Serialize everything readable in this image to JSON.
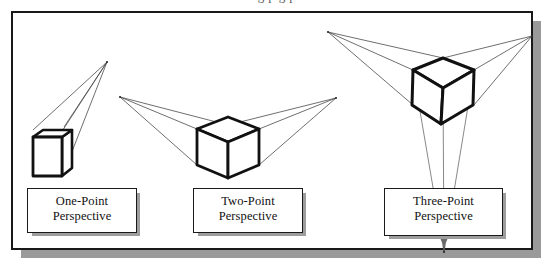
{
  "page": {
    "cutoff_text_above": "g    p     g p",
    "background_color": "#ffffff",
    "frame_border_color": "#19191a",
    "shadow_color": "#9a9a9a",
    "line_color": "#3a3a3a",
    "cube_outline_color": "#111111"
  },
  "figure": {
    "title": "",
    "panels": [
      {
        "id": "one-point",
        "caption_line1": "One-Point",
        "caption_line2": "Perspective",
        "vanishing_points": 1,
        "vp_positions": [
          [
            107,
            62
          ]
        ],
        "cube_center": [
          55,
          150
        ]
      },
      {
        "id": "two-point",
        "caption_line1": "Two-Point",
        "caption_line2": "Perspective",
        "vanishing_points": 2,
        "vp_positions": [
          [
            120,
            97
          ],
          [
            336,
            98
          ]
        ],
        "cube_center": [
          226,
          148
        ]
      },
      {
        "id": "three-point",
        "caption_line1": "Three-Point",
        "caption_line2": "Perspective",
        "vanishing_points": 3,
        "vp_positions": [
          [
            328,
            32
          ],
          [
            532,
            36
          ],
          [
            444,
            252
          ]
        ],
        "cube_center": [
          443,
          88
        ]
      }
    ]
  }
}
